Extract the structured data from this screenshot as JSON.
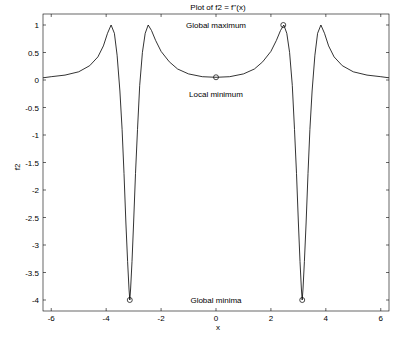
{
  "chart_data": {
    "type": "line",
    "title": "Plot of f2 = f''(x)",
    "xlabel": "x",
    "ylabel": "f2",
    "xlim": [
      -6.3,
      6.3
    ],
    "ylim": [
      -4.2,
      1.2
    ],
    "grid": false,
    "legend": null,
    "x_ticks": [
      -6,
      -4,
      -2,
      0,
      2,
      4,
      6
    ],
    "x_tick_labels": [
      "-6",
      "-4",
      "-2",
      "0",
      "2",
      "4",
      "6"
    ],
    "y_ticks": [
      1,
      0.5,
      0,
      -0.5,
      -1,
      -1.5,
      -2,
      -2.5,
      -3,
      -3.5,
      -4
    ],
    "y_tick_labels": [
      "1",
      "0.5",
      "0",
      "-0.5",
      "-1",
      "-1.5",
      "-2",
      "-2.5",
      "-3",
      "-3.5",
      "-4"
    ],
    "series": [
      {
        "name": "f2",
        "color": "#000000",
        "x": [
          -6.3,
          -6.0,
          -5.5,
          -5.0,
          -4.6,
          -4.3,
          -4.1,
          -3.95,
          -3.82,
          -3.7,
          -3.6,
          -3.5,
          -3.42,
          -3.35,
          -3.28,
          -3.22,
          -3.17,
          -3.14,
          -3.11,
          -3.06,
          -3.0,
          -2.93,
          -2.86,
          -2.78,
          -2.68,
          -2.58,
          -2.47,
          -2.35,
          -2.2,
          -2.0,
          -1.7,
          -1.4,
          -1.0,
          -0.5,
          0.0,
          0.5,
          1.0,
          1.4,
          1.7,
          2.0,
          2.2,
          2.35,
          2.47,
          2.58,
          2.68,
          2.78,
          2.86,
          2.93,
          3.0,
          3.06,
          3.11,
          3.14,
          3.17,
          3.22,
          3.28,
          3.35,
          3.42,
          3.5,
          3.6,
          3.7,
          3.82,
          3.95,
          4.1,
          4.3,
          4.6,
          5.0,
          5.5,
          6.0,
          6.3
        ],
        "y": [
          0.04,
          0.06,
          0.09,
          0.15,
          0.26,
          0.42,
          0.62,
          0.85,
          1.0,
          0.85,
          0.45,
          -0.2,
          -0.9,
          -1.7,
          -2.6,
          -3.3,
          -3.8,
          -4.0,
          -3.8,
          -3.3,
          -2.6,
          -1.7,
          -0.9,
          -0.1,
          0.5,
          0.85,
          1.0,
          0.9,
          0.72,
          0.52,
          0.33,
          0.2,
          0.11,
          0.06,
          0.05,
          0.06,
          0.11,
          0.2,
          0.33,
          0.52,
          0.72,
          0.9,
          1.0,
          0.85,
          0.5,
          -0.1,
          -0.9,
          -1.7,
          -2.6,
          -3.3,
          -3.8,
          -4.0,
          -3.8,
          -3.3,
          -2.6,
          -1.7,
          -0.9,
          -0.2,
          0.45,
          0.85,
          1.0,
          0.85,
          0.62,
          0.42,
          0.26,
          0.15,
          0.09,
          0.06,
          0.04
        ]
      }
    ],
    "markers": [
      {
        "name": "global-maximum-marker",
        "x": 2.45,
        "y": 1.0
      },
      {
        "name": "local-minimum-marker",
        "x": 0.0,
        "y": 0.05
      },
      {
        "name": "global-minimum-left-marker",
        "x": -3.14,
        "y": -4.0
      },
      {
        "name": "global-minimum-right-marker",
        "x": 3.14,
        "y": -4.0
      }
    ],
    "annotations": [
      {
        "name": "global-maximum-label",
        "text": "Global maximum",
        "x": 0.0,
        "y": 1.0
      },
      {
        "name": "local-minimum-label",
        "text": "Local minimum",
        "x": 0.0,
        "y": -0.25
      },
      {
        "name": "global-minima-label",
        "text": "Global minima",
        "x": 0.0,
        "y": -4.0
      }
    ]
  }
}
